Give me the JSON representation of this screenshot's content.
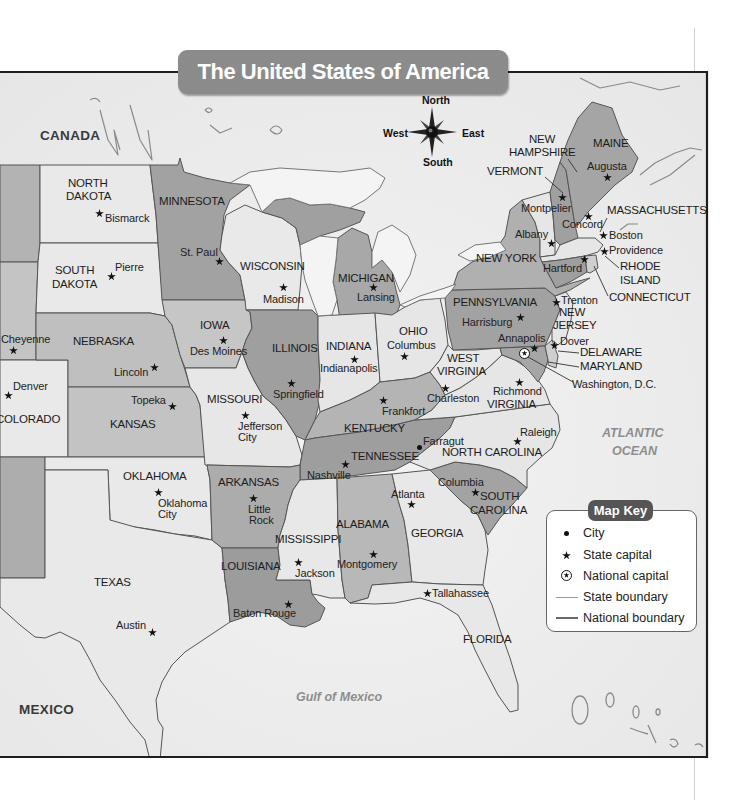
{
  "title": "The United States of America",
  "compass": {
    "north": "North",
    "south": "South",
    "east": "East",
    "west": "West",
    "icon": "compass-rose-icon"
  },
  "regions": {
    "canada": "CANADA",
    "mexico": "MEXICO",
    "gulf": "Gulf of Mexico",
    "atlantic": [
      "ATLANTIC",
      "OCEAN"
    ]
  },
  "states": {
    "north_dakota": [
      "NORTH",
      "DAKOTA"
    ],
    "minnesota": "MINNESOTA",
    "south_dakota": [
      "SOUTH",
      "DAKOTA"
    ],
    "wisconsin": "WISCONSIN",
    "michigan": "MICHIGAN",
    "new_york": "NEW YORK",
    "maine": "MAINE",
    "new_hampshire": [
      "NEW",
      "HAMPSHIRE"
    ],
    "vermont": "VERMONT",
    "massachusetts": "MASSACHUSETTS",
    "rhode_island": [
      "RHODE",
      "ISLAND"
    ],
    "connecticut": "CONNECTICUT",
    "pennsylvania": "PENNSYLVANIA",
    "new_jersey": [
      "NEW",
      "JERSEY"
    ],
    "delaware": "DELAWARE",
    "maryland": "MARYLAND",
    "ohio": "OHIO",
    "indiana": "INDIANA",
    "illinois": "ILLINOIS",
    "iowa": "IOWA",
    "nebraska": "NEBRASKA",
    "missouri": "MISSOURI",
    "kansas": "KANSAS",
    "colorado": "COLORADO",
    "kentucky": "KENTUCKY",
    "west_virginia": [
      "WEST",
      "VIRGINIA"
    ],
    "virginia": "VIRGINIA",
    "tennessee": "TENNESSEE",
    "north_carolina": "NORTH CAROLINA",
    "oklahoma": "OKLAHOMA",
    "arkansas": "ARKANSAS",
    "mississippi": "MISSISSIPPI",
    "alabama": "ALABAMA",
    "georgia": "GEORGIA",
    "south_carolina": [
      "SOUTH",
      "CAROLINA"
    ],
    "louisiana": "LOUISIANA",
    "texas": "TEXAS",
    "florida": "FLORIDA"
  },
  "cities": {
    "bismarck": {
      "name": "Bismarck",
      "type": "state capital"
    },
    "st_paul": {
      "name": "St. Paul",
      "type": "state capital"
    },
    "pierre": {
      "name": "Pierre",
      "type": "state capital"
    },
    "madison": {
      "name": "Madison",
      "type": "state capital"
    },
    "lansing": {
      "name": "Lansing",
      "type": "state capital"
    },
    "augusta": {
      "name": "Augusta",
      "type": "state capital"
    },
    "montpelier": {
      "name": "Montpelier",
      "type": "state capital"
    },
    "concord": {
      "name": "Concord",
      "type": "state capital"
    },
    "albany": {
      "name": "Albany",
      "type": "state capital"
    },
    "boston": {
      "name": "Boston",
      "type": "state capital"
    },
    "providence": {
      "name": "Providence",
      "type": "state capital"
    },
    "hartford": {
      "name": "Hartford",
      "type": "state capital"
    },
    "trenton": {
      "name": "Trenton",
      "type": "state capital"
    },
    "harrisburg": {
      "name": "Harrisburg",
      "type": "state capital"
    },
    "annapolis": {
      "name": "Annapolis",
      "type": "state capital"
    },
    "dover": {
      "name": "Dover",
      "type": "state capital"
    },
    "washington_dc": {
      "name": "Washington, D.C.",
      "type": "national capital"
    },
    "columbus": {
      "name": "Columbus",
      "type": "state capital"
    },
    "indianapolis": {
      "name": "Indianapolis",
      "type": "state capital"
    },
    "springfield": {
      "name": "Springfield",
      "type": "state capital"
    },
    "des_moines": {
      "name": "Des Moines",
      "type": "state capital"
    },
    "cheyenne": {
      "name": "Cheyenne",
      "type": "state capital"
    },
    "lincoln": {
      "name": "Lincoln",
      "type": "state capital"
    },
    "denver": {
      "name": "Denver",
      "type": "state capital"
    },
    "topeka": {
      "name": "Topeka",
      "type": "state capital"
    },
    "jefferson_city": {
      "name": "Jefferson City",
      "lines": [
        "Jefferson",
        "City"
      ],
      "type": "state capital"
    },
    "frankfort": {
      "name": "Frankfort",
      "type": "state capital"
    },
    "charleston": {
      "name": "Charleston",
      "type": "state capital"
    },
    "richmond": {
      "name": "Richmond",
      "type": "state capital"
    },
    "raleigh": {
      "name": "Raleigh",
      "type": "state capital"
    },
    "farragut": {
      "name": "Farragut",
      "type": "city"
    },
    "nashville": {
      "name": "Nashville",
      "type": "state capital"
    },
    "oklahoma_city": {
      "name": "Oklahoma City",
      "lines": [
        "Oklahoma",
        "City"
      ],
      "type": "state capital"
    },
    "little_rock": {
      "name": "Little Rock",
      "lines": [
        "Little",
        "Rock"
      ],
      "type": "state capital"
    },
    "atlanta": {
      "name": "Atlanta",
      "type": "state capital"
    },
    "columbia": {
      "name": "Columbia",
      "type": "state capital"
    },
    "jackson": {
      "name": "Jackson",
      "type": "state capital"
    },
    "montgomery": {
      "name": "Montgomery",
      "type": "state capital"
    },
    "baton_rouge": {
      "name": "Baton Rouge",
      "type": "state capital"
    },
    "tallahassee": {
      "name": "Tallahassee",
      "type": "state capital"
    },
    "austin": {
      "name": "Austin",
      "type": "state capital"
    }
  },
  "map_key": {
    "title": "Map Key",
    "items": [
      {
        "label": "City",
        "symbol": "dot-icon"
      },
      {
        "label": "State capital",
        "symbol": "star-icon"
      },
      {
        "label": "National capital",
        "symbol": "circled-star-icon"
      },
      {
        "label": "State boundary",
        "symbol": "thin-line-icon"
      },
      {
        "label": "National boundary",
        "symbol": "thick-line-icon"
      }
    ]
  },
  "colors": {
    "title_banner": "#8b8b8b",
    "key_title": "#555555",
    "frame_border": "#1e1e1e",
    "water_and_foreign_land": "#ededed",
    "state_light": "#e8e8e8",
    "state_dark": "#a2a2a2"
  }
}
